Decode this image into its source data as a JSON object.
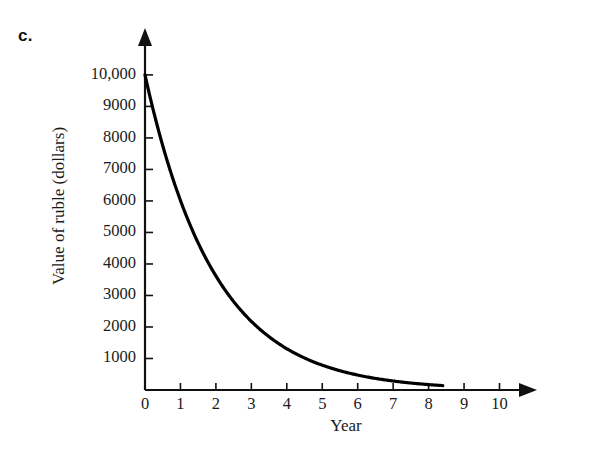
{
  "figure": {
    "part_label": "c.",
    "background_color": "#ffffff",
    "ink_color": "#111111"
  },
  "chart_data": {
    "type": "line",
    "title": "",
    "subtitle": "",
    "xlabel": "Year",
    "ylabel": "Value of ruble (dollars)",
    "xlim": [
      0,
      10.55
    ],
    "ylim": [
      0,
      10600
    ],
    "grid": false,
    "legend": null,
    "axis_style": "arrow-tipped single quadrant, ticks outside, no gridlines",
    "x_ticks": [
      0,
      1,
      2,
      3,
      4,
      5,
      6,
      7,
      8,
      9,
      10
    ],
    "x_tick_labels": [
      "0",
      "1",
      "2",
      "3",
      "4",
      "5",
      "6",
      "7",
      "8",
      "9",
      "10"
    ],
    "y_ticks": [
      1000,
      2000,
      3000,
      4000,
      5000,
      6000,
      7000,
      8000,
      9000,
      10000
    ],
    "y_tick_labels": [
      "1000",
      "2000",
      "3000",
      "4000",
      "5000",
      "6000",
      "7000",
      "8000",
      "9000",
      "10,000"
    ],
    "series": [
      {
        "name": "Value of ruble",
        "kind": "exponential-decay",
        "line_color": "#000000",
        "line_width": 3,
        "x_start": 0,
        "x_end": 8.4,
        "x": [
          0,
          0.5,
          1,
          1.5,
          2,
          2.5,
          3,
          3.5,
          4,
          4.5,
          5,
          5.5,
          6,
          6.5,
          7,
          7.5,
          8,
          8.4
        ],
        "values": [
          10000,
          7750,
          6000,
          4650,
          3600,
          2790,
          2160,
          1675,
          1300,
          1005,
          780,
          604,
          468,
          363,
          281,
          218,
          169,
          140
        ]
      }
    ]
  },
  "annotations": []
}
